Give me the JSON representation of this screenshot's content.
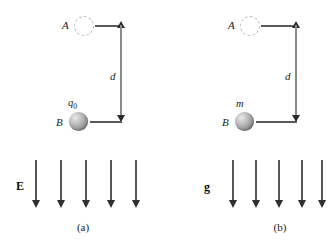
{
  "figure": {
    "width": 332,
    "height": 252,
    "background_color": "#ffffff",
    "arrow_color": "#55555a",
    "sphere_color": "#a3a3a3",
    "dashed_circle_color": "#b9b9b9",
    "dimension_line_color": "#8a8a8a"
  },
  "panels": [
    {
      "id": "a",
      "caption": "(a)",
      "point_a_label": "A",
      "point_b_label": "B",
      "object_label": "q",
      "object_label_sub": "0",
      "distance_label": "d",
      "field_label": "E",
      "field_description": "uniform downward electric field",
      "arrow_count": 5
    },
    {
      "id": "b",
      "caption": "(b)",
      "point_a_label": "A",
      "point_b_label": "B",
      "object_label": "m",
      "object_label_sub": "",
      "distance_label": "d",
      "field_label": "g",
      "field_description": "uniform downward gravitational field",
      "arrow_count": 5
    }
  ]
}
